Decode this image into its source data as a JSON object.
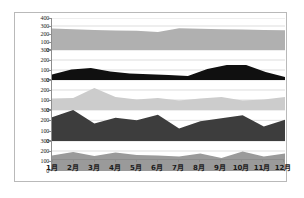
{
  "chart_data": {
    "type": "area",
    "title": "",
    "subtitle": "",
    "xlabel": "",
    "ylabel": "",
    "grid": true,
    "legend_position": "none",
    "layout": "5 stacked panels sharing one x-axis",
    "categories": [
      "1月",
      "2月",
      "3月",
      "4月",
      "5月",
      "6月",
      "7月",
      "8月",
      "9月",
      "10月",
      "11月",
      "12月"
    ],
    "panels": [
      {
        "index": 1,
        "name": "panel-1",
        "fill_color": "#b0b0b0",
        "ylim": [
          0,
          400
        ],
        "yticks": [
          0,
          100,
          200,
          300,
          400
        ],
        "values": [
          270,
          258,
          250,
          245,
          240,
          225,
          272,
          265,
          260,
          255,
          250,
          248
        ]
      },
      {
        "index": 2,
        "name": "panel-2",
        "fill_color": "#101010",
        "ylim": [
          0,
          300
        ],
        "yticks": [
          0,
          100,
          200,
          300
        ],
        "values": [
          55,
          105,
          120,
          85,
          65,
          58,
          50,
          40,
          110,
          150,
          150,
          80,
          30
        ]
      },
      {
        "index": 3,
        "name": "panel-3",
        "fill_color": "#cccccc",
        "ylim": [
          0,
          300
        ],
        "yticks": [
          0,
          100,
          200,
          300
        ],
        "values": [
          115,
          120,
          220,
          130,
          105,
          120,
          95,
          115,
          130,
          95,
          105,
          130
        ]
      },
      {
        "index": 4,
        "name": "panel-4",
        "fill_color": "#3d3d3d",
        "ylim": [
          0,
          300
        ],
        "yticks": [
          0,
          100,
          200,
          300
        ],
        "values": [
          230,
          300,
          170,
          225,
          200,
          255,
          120,
          190,
          220,
          250,
          140,
          205
        ]
      },
      {
        "index": 5,
        "name": "panel-5",
        "fill_color": "#9a9a9a",
        "ylim": [
          0,
          300
        ],
        "yticks": [
          0,
          100,
          200,
          300
        ],
        "values": [
          155,
          190,
          150,
          185,
          160,
          155,
          145,
          175,
          130,
          195,
          145,
          175
        ]
      }
    ]
  },
  "axis": {
    "tick_0": "0",
    "tick_100": "100",
    "tick_200": "200",
    "tick_300": "300",
    "tick_400": "400"
  }
}
